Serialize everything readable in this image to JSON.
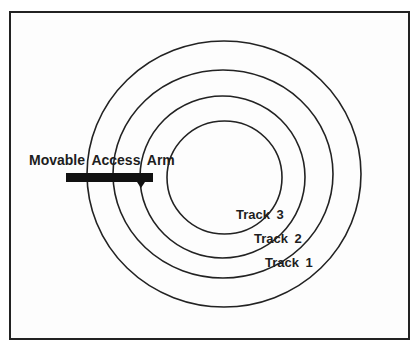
{
  "diagram": {
    "type": "disk-tracks",
    "arm_label": "Movable Access Arm",
    "tracks": [
      {
        "label": "Track 3"
      },
      {
        "label": "Track 2"
      },
      {
        "label": "Track 1"
      }
    ],
    "colors": {
      "line": "#222222",
      "arm": "#111111",
      "background": "#ffffff"
    }
  }
}
